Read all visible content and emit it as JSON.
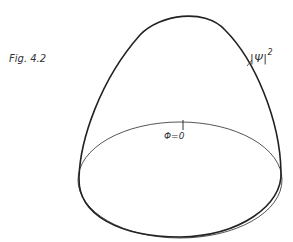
{
  "figure": {
    "caption": "Fig. 4.2",
    "curve_label": "|Ψ|",
    "curve_label_exponent": "2",
    "angle_label": "Φ=0"
  },
  "geometry": {
    "peak": [
      183,
      11
    ],
    "ellipse": {
      "cx": 180,
      "cy": 180,
      "rx": 102,
      "ry": 59
    }
  }
}
